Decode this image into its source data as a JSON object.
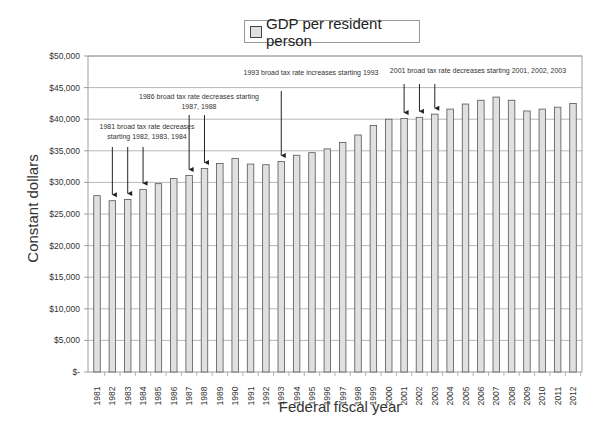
{
  "chart_data": {
    "type": "bar",
    "title": "",
    "legend": [
      "GDP per resident person"
    ],
    "legend_position": "top",
    "xlabel": "Federal fiscal year",
    "ylabel": "Constant dollars",
    "ylim": [
      0,
      50000
    ],
    "grid": true,
    "y_ticks": [
      "$-",
      "$5,000",
      "$10,000",
      "$15,000",
      "$20,000",
      "$25,000",
      "$30,000",
      "$35,000",
      "$40,000",
      "$45,000",
      "$50,000"
    ],
    "categories": [
      "1981",
      "1982",
      "1983",
      "1984",
      "1985",
      "1986",
      "1987",
      "1988",
      "1989",
      "1990",
      "1991",
      "1992",
      "1993",
      "1994",
      "1995",
      "1996",
      "1997",
      "1998",
      "1999",
      "2000",
      "2001",
      "2002",
      "2003",
      "2004",
      "2005",
      "2006",
      "2007",
      "2008",
      "2009",
      "2010",
      "2011",
      "2012"
    ],
    "series": [
      {
        "name": "GDP per resident person",
        "values": [
          27900,
          27100,
          27300,
          28900,
          29800,
          30600,
          31100,
          32200,
          33000,
          33800,
          32900,
          32800,
          33300,
          34300,
          34700,
          35300,
          36300,
          37500,
          39000,
          40000,
          40100,
          40300,
          40800,
          41600,
          42400,
          43000,
          43500,
          43000,
          41300,
          41600,
          41900,
          42500
        ]
      }
    ],
    "annotations": [
      {
        "text_lines": [
          "1981 broad tax rate decreases",
          "starting 1982, 1983, 1984"
        ],
        "arrows_to": [
          "1982",
          "1983",
          "1984"
        ]
      },
      {
        "text_lines": [
          "1986 broad tax rate decreases starting",
          "1987, 1988"
        ],
        "arrows_to": [
          "1987",
          "1988"
        ]
      },
      {
        "text_lines": [
          "1993 broad tax rate increases starting 1993"
        ],
        "arrows_to": [
          "1993"
        ]
      },
      {
        "text_lines": [
          "2001 broad tax rate decreases starting 2001, 2002, 2003"
        ],
        "arrows_to": [
          "2001",
          "2002",
          "2003"
        ]
      }
    ]
  },
  "colors": {
    "bar_fill": "#e0e0e0",
    "bar_stroke": "#555555",
    "grid": "#9a9a9a",
    "axis": "#888888",
    "text": "#333333"
  }
}
